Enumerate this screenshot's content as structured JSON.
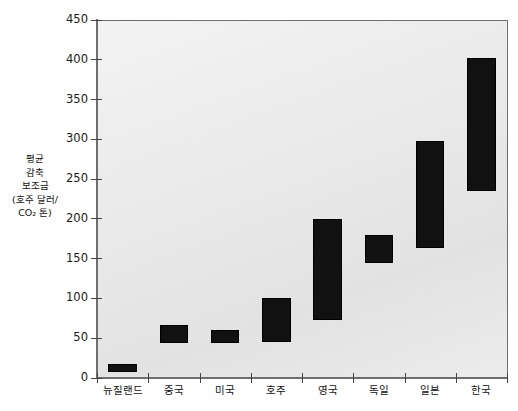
{
  "chart_data": {
    "type": "bar",
    "title": "",
    "subtitle": "",
    "xlabel": "",
    "ylabel": "평균 감축 보조금 (호주 달러/CO₂ 톤)",
    "ylabel_lines": [
      "평균",
      "감축",
      "보조금",
      "(호주 달러/",
      "CO₂ 톤)"
    ],
    "ylim": [
      0,
      450
    ],
    "yticks": [
      0,
      50,
      100,
      150,
      200,
      250,
      300,
      350,
      400,
      450
    ],
    "ytick_labels": [
      "0",
      "50",
      "100",
      "150",
      "200",
      "250",
      "300",
      "350",
      "400",
      "450"
    ],
    "grid": false,
    "legend": null,
    "bar_style": "floating-range",
    "bar_color": "#111111",
    "plot_background": "#ebebeb",
    "categories": [
      "뉴질랜드",
      "중국",
      "미국",
      "호주",
      "영국",
      "독일",
      "일본",
      "한국"
    ],
    "series": [
      {
        "name": "평균 감축 보조금 범위",
        "low": [
          7,
          44,
          44,
          45,
          73,
          145,
          163,
          235
        ],
        "high": [
          18,
          67,
          60,
          100,
          200,
          180,
          298,
          402
        ]
      }
    ],
    "values": [
      {
        "category": "뉴질랜드",
        "low": 7,
        "high": 18
      },
      {
        "category": "중국",
        "low": 44,
        "high": 67
      },
      {
        "category": "미국",
        "low": 44,
        "high": 60
      },
      {
        "category": "호주",
        "low": 45,
        "high": 100
      },
      {
        "category": "영국",
        "low": 73,
        "high": 200
      },
      {
        "category": "독일",
        "low": 145,
        "high": 180
      },
      {
        "category": "일본",
        "low": 163,
        "high": 298
      },
      {
        "category": "한국",
        "low": 235,
        "high": 402
      }
    ]
  }
}
